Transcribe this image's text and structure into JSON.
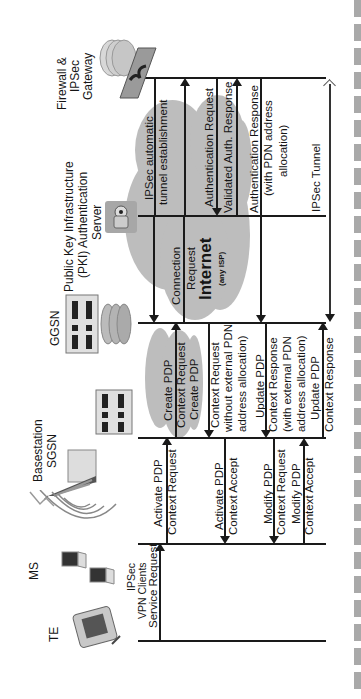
{
  "diagram": {
    "entities": [
      {
        "id": "firewall",
        "label": "Firewall &\nIPSec\nGateway",
        "lines": [
          "Firewall &",
          "IPSec",
          "Gateway"
        ]
      },
      {
        "id": "pki",
        "label": "Public Key Infrastructure (PKI) Authentication Server",
        "lines": [
          "Public Key Infrastructure",
          "(PKI) Authentication",
          "Server"
        ]
      },
      {
        "id": "ggsn",
        "label": "GGSN"
      },
      {
        "id": "sgsn",
        "label": "Basestation SGSN",
        "lines": [
          "Basestation",
          "SGSN"
        ]
      },
      {
        "id": "ms",
        "label": "MS"
      },
      {
        "id": "te",
        "label": "TE"
      }
    ],
    "clouds": [
      {
        "id": "internet",
        "label": "Internet",
        "sublabel": "(any ISP)"
      },
      {
        "id": "gprs-core",
        "label": ""
      }
    ],
    "te_caption": {
      "lines": [
        "IPSec",
        "VPN Clients"
      ]
    },
    "messages": [
      {
        "id": "m1",
        "from": "te",
        "to": "ms",
        "lines": [
          "Service Request"
        ],
        "direction": "up"
      },
      {
        "id": "m2",
        "from": "ms",
        "to": "sgsn",
        "lines": [
          "Activate PDP",
          "Context Request"
        ],
        "direction": "up"
      },
      {
        "id": "m3",
        "from": "sgsn",
        "to": "ggsn",
        "lines": [
          "Create PDP",
          "Context Request"
        ],
        "direction": "up"
      },
      {
        "id": "m4",
        "from": "ggsn",
        "to": "pki",
        "lines": [
          "Connection",
          "Request"
        ],
        "direction": "up"
      },
      {
        "id": "m5",
        "from": "pki",
        "to": "firewall",
        "lines": [
          "IPSec automatic",
          "tunnel establishment"
        ],
        "direction": "up"
      },
      {
        "id": "m6",
        "from": "firewall",
        "to": "pki",
        "lines": [
          "Authentication Request"
        ],
        "direction": "down"
      },
      {
        "id": "m7",
        "from": "pki",
        "to": "firewall",
        "lines": [
          "Validated Auth. Response"
        ],
        "direction": "up"
      },
      {
        "id": "m8",
        "from": "firewall",
        "to": "ggsn",
        "lines": [
          "Authentication Response",
          "(with PDN address",
          "allocation)"
        ],
        "direction": "down"
      },
      {
        "id": "m9",
        "from": "ggsn",
        "to": "sgsn",
        "lines": [
          "Create PDP",
          "Context Request",
          "without external PDN",
          "address allocation)"
        ],
        "direction": "down"
      },
      {
        "id": "m10",
        "from": "sgsn",
        "to": "ms",
        "lines": [
          "Activate PDP",
          "Context Accept"
        ],
        "direction": "down"
      },
      {
        "id": "m11",
        "from": "ggsn",
        "to": "sgsn",
        "lines": [
          "Update PDP",
          "Context Response",
          "(with external PDN",
          "address allocation)"
        ],
        "direction": "down"
      },
      {
        "id": "m12",
        "from": "sgsn",
        "to": "ms",
        "lines": [
          "Modify PDP",
          "Context Request"
        ],
        "direction": "down"
      },
      {
        "id": "m13",
        "from": "ms",
        "to": "sgsn",
        "lines": [
          "Modify PDP",
          "Context Accept"
        ],
        "direction": "up"
      },
      {
        "id": "m14",
        "from": "sgsn",
        "to": "ggsn",
        "lines": [
          "Update PDP",
          "Context Response"
        ],
        "direction": "up"
      },
      {
        "id": "m15",
        "from": "firewall",
        "to": "ggsn",
        "lines": [
          "IPSec Tunnel"
        ],
        "direction": "both"
      }
    ],
    "labels": {
      "firewall_1": "Firewall &",
      "firewall_2": "IPSec",
      "firewall_3": "Gateway",
      "pki_1": "Public Key Infrastructure",
      "pki_2": "(PKI) Authentication",
      "pki_3": "Server",
      "ggsn": "GGSN",
      "sgsn_1": "Basestation",
      "sgsn_2": "SGSN",
      "ms": "MS",
      "te": "TE",
      "te_cap_1": "IPSec",
      "te_cap_2": "VPN Clients",
      "internet": "Internet",
      "internet_sub": "(any ISP)",
      "m1": "Service Request",
      "m2a": "Activate PDP",
      "m2b": "Context Request",
      "m3a": "Create PDP",
      "m3b": "Context Request",
      "m3c": "Create PDP",
      "m4a": "Connection",
      "m4b": "Request",
      "m5a": "IPSec automatic",
      "m5b": "tunnel establishment",
      "m6": "Authentication Request",
      "m7": "Validated Auth. Response",
      "m8a": "Authentication Response",
      "m8b": "(with PDN address",
      "m8c": "allocation)",
      "m9a": "Context Request",
      "m9b": "without external PDN",
      "m9c": "address allocation)",
      "m10a": "Activate PDP",
      "m10b": "Context Accept",
      "m11a": "Update PDP",
      "m11b": "Context Response",
      "m11c": "(with external PDN",
      "m11d": "address allocation)",
      "m12a": "Modify PDP",
      "m12b": "Context Request",
      "m13a": "Modify PDP",
      "m13b": "Context Accept",
      "m14a": "Update PDP",
      "m14b": "Context Response",
      "m15": "IPSec Tunnel"
    }
  },
  "colors": {
    "line": "#1a1a1a",
    "cloud": "#bdbdbd",
    "side_blocks": "#a9a9a9",
    "background": "#ffffff"
  }
}
